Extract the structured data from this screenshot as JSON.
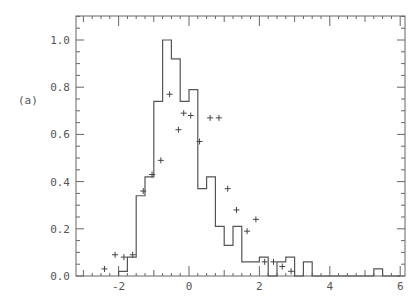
{
  "panel_label": "(a)",
  "chart_data": {
    "type": "bar",
    "subtype": "histogram_with_points",
    "title": "",
    "xlabel": "",
    "ylabel": "",
    "xlim": [
      -3,
      6
    ],
    "ylim": [
      0,
      1.1
    ],
    "xticks": [
      -2,
      0,
      2,
      4,
      6
    ],
    "yticks": [
      0.0,
      0.2,
      0.4,
      0.6,
      0.8,
      1.0
    ],
    "ytick_labels": [
      "0.0",
      "0.2",
      "0.4",
      "0.6",
      "0.8",
      "1.0"
    ],
    "bin_width": 0.25,
    "histogram": {
      "bin_starts": [
        -2.0,
        -1.75,
        -1.5,
        -1.25,
        -1.0,
        -0.75,
        -0.5,
        -0.25,
        0.0,
        0.25,
        0.5,
        0.75,
        1.0,
        1.25,
        1.5,
        1.75,
        2.0,
        2.25,
        2.5,
        2.75,
        3.0,
        3.25,
        3.5,
        3.75,
        4.0,
        4.25,
        4.5,
        4.75,
        5.0,
        5.25,
        5.5,
        5.75
      ],
      "values": [
        0.02,
        0.08,
        0.34,
        0.42,
        0.74,
        1.0,
        0.92,
        0.74,
        0.79,
        0.37,
        0.42,
        0.21,
        0.13,
        0.21,
        0.06,
        0.06,
        0.08,
        0.0,
        0.06,
        0.08,
        0.0,
        0.06,
        0.0,
        0.0,
        0.0,
        0.0,
        0.0,
        0.0,
        0.0,
        0.03,
        0.0,
        0.0
      ]
    },
    "points": {
      "x": [
        -2.4,
        -2.1,
        -1.85,
        -1.6,
        -1.3,
        -1.05,
        -0.8,
        -0.55,
        -0.3,
        -0.15,
        0.05,
        0.3,
        0.6,
        0.85,
        1.1,
        1.35,
        1.65,
        1.9,
        2.15,
        2.4,
        2.65,
        2.9
      ],
      "y": [
        0.03,
        0.09,
        0.08,
        0.09,
        0.36,
        0.43,
        0.49,
        0.77,
        0.62,
        0.69,
        0.68,
        0.57,
        0.67,
        0.67,
        0.37,
        0.28,
        0.19,
        0.24,
        0.06,
        0.06,
        0.04,
        0.02
      ]
    }
  }
}
